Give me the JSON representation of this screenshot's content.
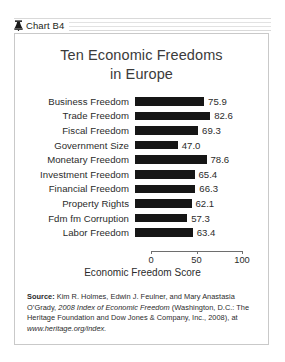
{
  "header": {
    "icon": "liberty-bell-icon",
    "label": "Chart B4"
  },
  "chart_data": {
    "type": "bar",
    "orientation": "horizontal",
    "title": "Ten Economic Freedoms in Europe",
    "title_line1": "Ten Economic Freedoms",
    "title_line2": "in Europe",
    "xlabel": "Economic Freedom Score",
    "ylabel": "",
    "xlim": [
      0,
      100
    ],
    "xticks": [
      0,
      50,
      100
    ],
    "xtick_labels": [
      "0",
      "50",
      "100"
    ],
    "grid": false,
    "legend": null,
    "bar_color": "#161616",
    "categories": [
      "Business Freedom",
      "Trade Freedom",
      "Fiscal Freedom",
      "Government Size",
      "Monetary Freedom",
      "Investment Freedom",
      "Financial Freedom",
      "Property Rights",
      "Fdm fm Corruption",
      "Labor Freedom"
    ],
    "values": [
      75.9,
      82.6,
      69.3,
      47.0,
      78.6,
      65.4,
      66.3,
      62.1,
      57.3,
      63.4
    ],
    "value_labels": [
      "75.9",
      "82.6",
      "69.3",
      "47.0",
      "78.6",
      "65.4",
      "66.3",
      "62.1",
      "57.3",
      "63.4"
    ]
  },
  "source": {
    "prefix": "Source:",
    "authors": " Kim R. Holmes, Edwin J. Feulner, and Mary Anastasia O’Grady, ",
    "year_italic_start": "2008 Index of Economic Freedom",
    "publisher": " (Washington, D.C.: The Heritage Foundation and Dow Jones & Company, Inc., 2008), at ",
    "url": "www.heritage.org/index."
  }
}
